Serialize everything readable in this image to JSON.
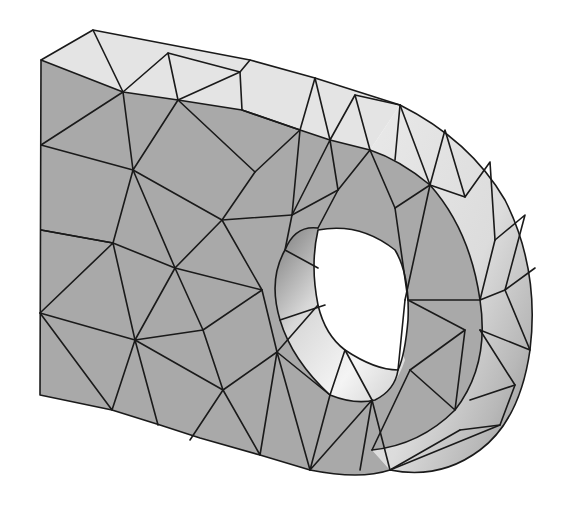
{
  "figure": {
    "colors": {
      "background": "#ffffff",
      "front_face": "#a9a9a9",
      "top_face": "#e4e4e4",
      "curved_face_light": "#e8e8e8",
      "curved_face_dark": "#8a8a8a",
      "hole_inner_light": "#f2f2f2",
      "hole_inner_dark": "#7a7a7a",
      "mesh_lines": "#1a1a1a"
    }
  }
}
